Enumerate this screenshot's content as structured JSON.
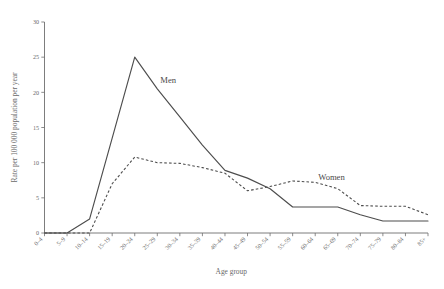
{
  "chart_data": {
    "type": "line",
    "title": "",
    "subtitle": "",
    "xlabel": "Age group",
    "ylabel": "Rate per 100 000 population per year",
    "categories": [
      "0–4",
      "5–9",
      "10–14",
      "15–19",
      "20–24",
      "25–29",
      "30–34",
      "35–39",
      "40–44",
      "45–49",
      "50–54",
      "55–59",
      "60–64",
      "65–69",
      "70–74",
      "75–79",
      "80–84",
      "85+"
    ],
    "series": [
      {
        "name": "Men",
        "style": "solid",
        "color": "#4d4d4d",
        "values": [
          0,
          0,
          2.0,
          13.5,
          25.0,
          20.5,
          16.5,
          12.5,
          8.9,
          7.8,
          6.3,
          3.7,
          3.7,
          3.7,
          2.6,
          1.7,
          1.7,
          1.7
        ]
      },
      {
        "name": "Women",
        "style": "dashed",
        "color": "#4d4d4d",
        "values": [
          0,
          0,
          0,
          7.0,
          10.8,
          10.0,
          9.9,
          9.3,
          8.5,
          6.0,
          6.6,
          7.4,
          7.2,
          6.3,
          3.9,
          3.8,
          3.8,
          2.6
        ]
      }
    ],
    "annotations": [
      {
        "text": "Men",
        "category": "25–29",
        "value": 21.3
      },
      {
        "text": "Women",
        "category": "60–64",
        "value": 7.6
      }
    ],
    "yticks": [
      0,
      5,
      10,
      15,
      20,
      25,
      30
    ],
    "ylim": [
      0,
      30
    ],
    "grid": false,
    "legend_position": "inline-annotations"
  },
  "axes": {
    "y_title": "Rate per 100 000 population per year",
    "x_title": "Age group"
  }
}
